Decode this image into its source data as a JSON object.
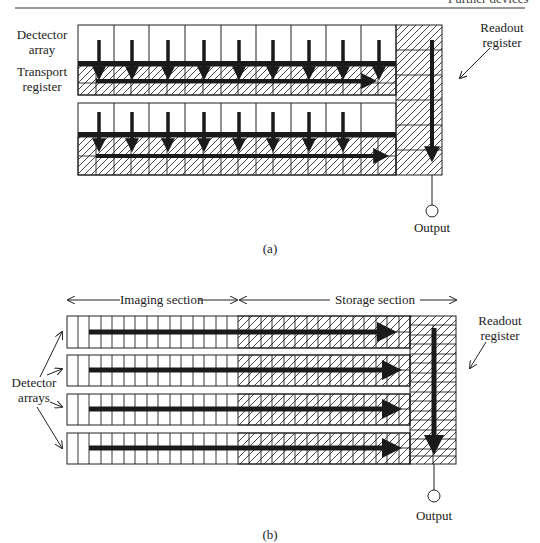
{
  "page_header": {
    "text": "Further devices"
  },
  "figure_a": {
    "caption": "(a)",
    "labels": {
      "detector_array": [
        "Dectector",
        "array"
      ],
      "transport_register": [
        "Transport",
        "register"
      ],
      "readout_register": [
        "Readout",
        "register"
      ],
      "output": "Output"
    },
    "blocks": 2,
    "detector_cells_per_block": 9,
    "transport_cells_per_block": 18
  },
  "figure_b": {
    "caption": "(b)",
    "labels": {
      "imaging_section": "Imaging section",
      "storage_section": "Storage section",
      "detector_arrays": [
        "Detector",
        "arrays"
      ],
      "readout_register": [
        "Readout",
        "register"
      ],
      "output": "Output"
    },
    "rows": 4,
    "imaging_cells_per_row": 17,
    "storage_cells_per_row": 15,
    "readout_cells": 16
  },
  "colors": {
    "ink": "#1a1a1a",
    "background": "#ffffff",
    "hatch": "#333333"
  }
}
